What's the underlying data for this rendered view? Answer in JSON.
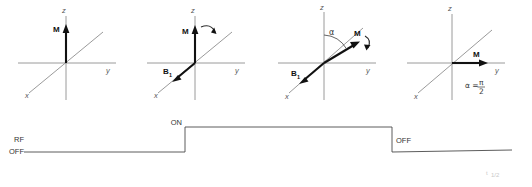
{
  "figure": {
    "colors": {
      "axis": "#8e8e8e",
      "vector": "#111111",
      "pulse": "#4a4a4a",
      "label": "#2a2a2a"
    }
  },
  "panels": [
    {
      "id": "panel-1",
      "caption": "Equilibrium magnetization along z",
      "axis_z": "z",
      "axis_y": "y",
      "axis_x": "x",
      "m_label": "M",
      "b1_label": "",
      "alpha_label": "",
      "has_b1": false,
      "has_rotation_arrow": false,
      "has_alpha": false
    },
    {
      "id": "panel-2",
      "caption": "B1 field applied along x, M begins to tip",
      "axis_z": "z",
      "axis_y": "y",
      "axis_x": "x",
      "m_label": "M",
      "b1_label": "B",
      "b1_sub": "1",
      "alpha_label": "",
      "has_b1": true,
      "has_rotation_arrow": true,
      "has_alpha": false
    },
    {
      "id": "panel-3",
      "caption": "M tipped by flip angle alpha",
      "axis_z": "z",
      "axis_y": "y",
      "axis_x": "x",
      "m_label": "M",
      "b1_label": "B",
      "b1_sub": "1",
      "alpha_label": "α",
      "has_b1": true,
      "has_rotation_arrow": true,
      "has_alpha": true
    },
    {
      "id": "panel-4",
      "caption": "M fully tipped into transverse plane along y",
      "axis_z": "z",
      "axis_y": "y",
      "axis_x": "x",
      "m_label": "M",
      "b1_label": "",
      "alpha_label": "",
      "has_b1": false,
      "has_rotation_arrow": false,
      "has_alpha": false,
      "equation": {
        "lhs": "α =",
        "numerator": "π",
        "denominator": "2",
        "full": "α = π/2"
      }
    }
  ],
  "pulse": {
    "name": "RF pulse timing diagram",
    "label_rf": "RF",
    "label_off_start": "OFF",
    "label_on": "ON",
    "label_off_end": "OFF",
    "rise_x": 185,
    "fall_x": 392,
    "baseline_y": 152,
    "high_y": 127
  },
  "artifacts": {
    "bottom_right": "t",
    "bottom_right_sub": "1/2",
    "top_right": ""
  }
}
